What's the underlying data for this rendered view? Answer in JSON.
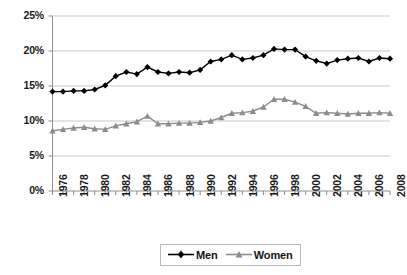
{
  "chart_data": {
    "type": "line",
    "title": "",
    "xlabel": "",
    "ylabel": "",
    "ylim": [
      0,
      25
    ],
    "yticks": [
      0,
      5,
      10,
      15,
      20,
      25
    ],
    "ytick_labels": [
      "0%",
      "5%",
      "10%",
      "15%",
      "20%",
      "25%"
    ],
    "grid": true,
    "legend_position": "bottom",
    "x": [
      1976,
      1977,
      1978,
      1979,
      1980,
      1981,
      1982,
      1983,
      1984,
      1985,
      1986,
      1987,
      1988,
      1989,
      1990,
      1991,
      1992,
      1993,
      1994,
      1995,
      1996,
      1997,
      1998,
      1999,
      2000,
      2001,
      2002,
      2003,
      2004,
      2005,
      2006,
      2007,
      2008
    ],
    "xtick_labels": [
      "1976",
      "1978",
      "1980",
      "1982",
      "1984",
      "1986",
      "1988",
      "1990",
      "1992",
      "1994",
      "1996",
      "1998",
      "2000",
      "2002",
      "2004",
      "2006",
      "2008"
    ],
    "xtick_values": [
      1976,
      1978,
      1980,
      1982,
      1984,
      1986,
      1988,
      1990,
      1992,
      1994,
      1996,
      1998,
      2000,
      2002,
      2004,
      2006,
      2008
    ],
    "series": [
      {
        "name": "Men",
        "color": "#000000",
        "marker": "diamond",
        "values": [
          14.2,
          14.2,
          14.3,
          14.3,
          14.5,
          15.1,
          16.4,
          17.0,
          16.7,
          17.7,
          17.0,
          16.8,
          17.0,
          16.9,
          17.3,
          18.5,
          18.8,
          19.4,
          18.8,
          19.0,
          19.4,
          20.3,
          20.2,
          20.2,
          19.2,
          18.6,
          18.2,
          18.7,
          18.9,
          19.0,
          18.5,
          19.0,
          18.9
        ]
      },
      {
        "name": "Women",
        "color": "#8c8c8c",
        "marker": "triangle",
        "values": [
          8.6,
          8.8,
          9.0,
          9.1,
          8.9,
          8.8,
          9.3,
          9.6,
          9.9,
          10.7,
          9.6,
          9.6,
          9.7,
          9.7,
          9.8,
          10.0,
          10.5,
          11.1,
          11.2,
          11.4,
          12.0,
          13.1,
          13.1,
          12.7,
          12.1,
          11.1,
          11.2,
          11.1,
          11.0,
          11.1,
          11.1,
          11.2,
          11.1
        ]
      }
    ]
  },
  "legend": {
    "items": [
      {
        "label": "Men"
      },
      {
        "label": "Women"
      }
    ]
  }
}
